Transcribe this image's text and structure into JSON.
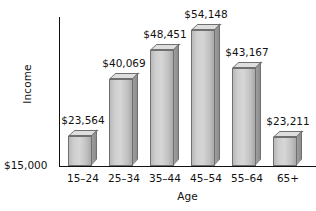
{
  "chart_data": {
    "type": "bar",
    "title": "",
    "xlabel": "Age",
    "ylabel": "Income",
    "categories": [
      "15–24",
      "25–34",
      "35–44",
      "45–54",
      "55–64",
      "65+"
    ],
    "values": [
      23564,
      40069,
      48451,
      54148,
      43167,
      23211
    ],
    "value_labels": [
      "$23,564",
      "$40,069",
      "$48,451",
      "$54,148",
      "$43,167",
      "$23,211"
    ],
    "baseline_label": "$15,000",
    "baseline_value": 15000,
    "ylim": [
      15000,
      56000
    ],
    "grid": false,
    "legend": false,
    "style_3d": true,
    "colors": {
      "bar_front": "#cfcfcf",
      "bar_top": "#dedede",
      "bar_side": "#969696",
      "bar_outline": "#6f6f6f",
      "axis": "#111111",
      "text": "#111111",
      "background": "#ffffff"
    }
  }
}
